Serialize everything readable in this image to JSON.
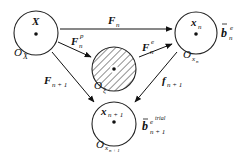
{
  "diagram": {
    "type": "configuration-mapping",
    "nodes": [
      {
        "id": "reference",
        "point_label": "X",
        "domain_label": "O",
        "domain_sub": "X",
        "hatched": false
      },
      {
        "id": "current",
        "point_label": "x",
        "point_sub": "n",
        "domain_label": "O",
        "domain_sub": "x",
        "domain_subsub": "n",
        "side_label": "b",
        "side_sub": "n",
        "side_sup": "e"
      },
      {
        "id": "intermediate",
        "domain_label": "O",
        "domain_sub": "ξ",
        "hatched": true
      },
      {
        "id": "next",
        "point_label": "x",
        "point_sub": "n + 1",
        "domain_label": "O",
        "domain_sub": "x",
        "domain_subsub": "n + 1",
        "side_label": "b",
        "side_sub": "n + 1",
        "side_sup": "e trial"
      }
    ],
    "edges": [
      {
        "from": "reference",
        "to": "current",
        "label": "F",
        "sub": "n",
        "sup": ""
      },
      {
        "from": "reference",
        "to": "intermediate",
        "label": "F",
        "sub": "n",
        "sup": "p"
      },
      {
        "from": "intermediate",
        "to": "current",
        "label": "F",
        "sub": "n",
        "sup": "e"
      },
      {
        "from": "reference",
        "to": "next",
        "label": "F",
        "sub": "n + 1",
        "sup": ""
      },
      {
        "from": "current",
        "to": "next",
        "label": "f",
        "sub": "n + 1",
        "sup": ""
      }
    ]
  },
  "labels": {
    "X": "X",
    "O": "O",
    "x": "x",
    "F": "F",
    "f": "f",
    "b": "b",
    "n": "n",
    "n1": "n + 1",
    "p": "p",
    "e": "e",
    "etrial": "e",
    "trial": "trial",
    "xi": "ξ"
  }
}
